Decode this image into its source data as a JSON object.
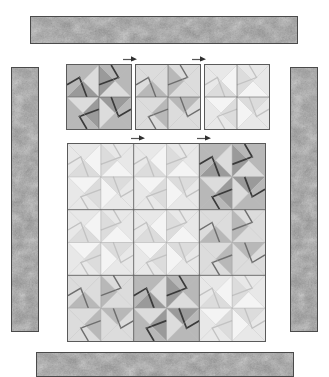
{
  "diagram": {
    "background_color": "#ffffff",
    "outline_color": "#5a5a5a"
  },
  "palette": {
    "dark_accent": "#3a3a3a",
    "dark": "#9a9a9a",
    "medium": "#b8b8b8",
    "light": "#dcdcdc",
    "lightest": "#f4f4f4",
    "background_patch": "#f2f2f2",
    "fabric_base": "#8e8e8e",
    "fabric_shade": "#6f6f6f",
    "fabric_highlight": "#c9c9c9",
    "block_outline": "#5a5a5a",
    "border_outline": "#4a4a4a"
  },
  "borders": [
    {
      "name": "top-border-strip",
      "fabric": "mottled-gray-leaf-print",
      "x": 30,
      "y": 16,
      "w": 268,
      "h": 28,
      "orientation": "horizontal"
    },
    {
      "name": "left-border-strip",
      "fabric": "mottled-gray-leaf-print",
      "x": 11,
      "y": 67,
      "w": 28,
      "h": 265,
      "orientation": "vertical"
    },
    {
      "name": "right-border-strip",
      "fabric": "mottled-gray-leaf-print",
      "x": 290,
      "y": 67,
      "w": 28,
      "h": 265,
      "orientation": "vertical"
    },
    {
      "name": "bottom-border-strip",
      "fabric": "mottled-gray-leaf-print",
      "x": 36,
      "y": 352,
      "w": 258,
      "h": 25,
      "orientation": "horizontal"
    }
  ],
  "sample_blocks": {
    "label": "Three pinwheel block colorways",
    "x": 66,
    "y": 64,
    "size": 66,
    "gap": 3,
    "items": [
      {
        "name": "sample-block-dark",
        "colorway": "dark",
        "value": "high contrast"
      },
      {
        "name": "sample-block-medium",
        "colorway": "medium",
        "value": "medium contrast"
      },
      {
        "name": "sample-block-light",
        "colorway": "light",
        "value": "low contrast"
      }
    ]
  },
  "quilt": {
    "name": "quilt-top-layout",
    "x": 67,
    "y": 143,
    "size": 199,
    "rows": 3,
    "cols": 3,
    "block_size": 66,
    "layout": [
      [
        "light",
        "light",
        "dark"
      ],
      [
        "light",
        "light",
        "medium"
      ],
      [
        "medium",
        "dark",
        "light"
      ]
    ]
  },
  "arrows": {
    "glyph": "arrow-right",
    "label": "seam pressing direction",
    "rows": [
      {
        "name": "arrow-row-sample-blocks",
        "y": 54,
        "xs": [
          123,
          192
        ]
      },
      {
        "name": "arrow-row-quilt-top",
        "y": 133,
        "xs": [
          131,
          197
        ]
      }
    ]
  }
}
